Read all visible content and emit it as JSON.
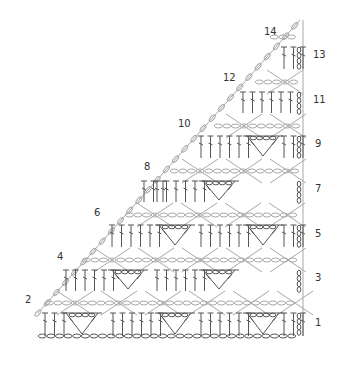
{
  "diagram": {
    "type": "crochet-chart",
    "shape": "right-triangle",
    "colors": {
      "odd_rows": "#555555",
      "even_rows": "#a8a8a8",
      "labels": "#333333",
      "background": "#ffffff"
    },
    "row_labels_right": [
      {
        "text": "1",
        "x": 315,
        "y": 326
      },
      {
        "text": "3",
        "x": 315,
        "y": 281
      },
      {
        "text": "5",
        "x": 315,
        "y": 237
      },
      {
        "text": "7",
        "x": 315,
        "y": 192
      },
      {
        "text": "9",
        "x": 315,
        "y": 147
      },
      {
        "text": "11",
        "x": 313,
        "y": 103
      },
      {
        "text": "13",
        "x": 313,
        "y": 58
      }
    ],
    "row_labels_left": [
      {
        "text": "2",
        "x": 25,
        "y": 303
      },
      {
        "text": "4",
        "x": 57,
        "y": 260
      },
      {
        "text": "6",
        "x": 94,
        "y": 216
      },
      {
        "text": "8",
        "x": 144,
        "y": 170
      },
      {
        "text": "10",
        "x": 178,
        "y": 127
      },
      {
        "text": "12",
        "x": 223,
        "y": 81
      },
      {
        "text": "14",
        "x": 264,
        "y": 35
      }
    ],
    "foundation_chain": {
      "x_start": 38,
      "x_end": 302,
      "y": 336
    },
    "odd_rows": [
      {
        "row": 1,
        "y": 336,
        "top": 313,
        "x_start": 38,
        "groups": [
          {
            "type": "dc",
            "count": 3,
            "x": 45
          },
          {
            "type": "shell",
            "x": 82
          },
          {
            "type": "dc",
            "count": 6,
            "x": 113
          },
          {
            "type": "shell",
            "x": 175
          },
          {
            "type": "dc",
            "count": 6,
            "x": 201
          },
          {
            "type": "shell",
            "x": 263
          },
          {
            "type": "dc",
            "count": 3,
            "x": 284
          }
        ]
      },
      {
        "row": 3,
        "y": 291,
        "top": 270,
        "x_start": 60,
        "groups": [
          {
            "type": "dc",
            "count": 6,
            "x": 66
          },
          {
            "type": "shell",
            "x": 128
          },
          {
            "type": "dc",
            "count": 6,
            "x": 157
          },
          {
            "type": "shell",
            "x": 219
          },
          {
            "type": "dc",
            "count": 0,
            "x": 290
          }
        ]
      },
      {
        "row": 5,
        "y": 247,
        "top": 225,
        "x_start": 97,
        "groups": [
          {
            "type": "dc",
            "count": 6,
            "x": 112
          },
          {
            "type": "shell",
            "x": 175
          },
          {
            "type": "dc",
            "count": 6,
            "x": 201
          },
          {
            "type": "shell",
            "x": 263
          },
          {
            "type": "dc",
            "count": 3,
            "x": 284
          }
        ]
      },
      {
        "row": 7,
        "y": 202,
        "top": 181,
        "x_start": 140,
        "groups": [
          {
            "type": "dc",
            "count": 3,
            "x": 144
          },
          {
            "type": "shell",
            "x": 219
          },
          {
            "type": "dc",
            "count": 6,
            "x": 157
          }
        ]
      },
      {
        "row": 9,
        "y": 158,
        "top": 136,
        "x_start": 185,
        "groups": [
          {
            "type": "dc",
            "count": 6,
            "x": 201
          },
          {
            "type": "shell",
            "x": 263
          },
          {
            "type": "dc",
            "count": 3,
            "x": 284
          }
        ]
      },
      {
        "row": 11,
        "y": 113,
        "top": 92,
        "x_start": 229,
        "groups": [
          {
            "type": "dc",
            "count": 6,
            "x": 243
          }
        ]
      },
      {
        "row": 13,
        "y": 69,
        "top": 47,
        "x_start": 270,
        "groups": [
          {
            "type": "dc",
            "count": 3,
            "x": 284
          }
        ]
      }
    ]
  }
}
